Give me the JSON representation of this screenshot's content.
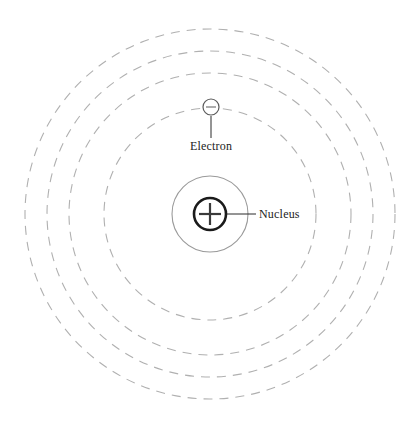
{
  "diagram": {
    "background_color": "#ffffff",
    "width": 419,
    "height": 426,
    "center": {
      "x": 210,
      "y": 214
    }
  },
  "nucleus": {
    "label": "Nucleus",
    "charge_symbol": "+",
    "radius": 16,
    "stroke_color": "#1a1a1a",
    "sign_color": "#3a3a3a",
    "label_x": 259,
    "label_y": 218,
    "leader": {
      "x1": 227,
      "y1": 214,
      "x2": 256,
      "y2": 214
    }
  },
  "electron": {
    "label": "Electron",
    "charge_symbol": "−",
    "radius": 8,
    "cx": 211,
    "cy": 107,
    "stroke_color": "#5a5a5a",
    "sign_color": "#6a6a6a",
    "label_x": 211,
    "label_y": 150,
    "leader": {
      "x1": 211,
      "y1": 116,
      "x2": 211,
      "y2": 138
    }
  },
  "orbits": [
    {
      "name": "orbit-inner-solid",
      "radius": 38,
      "style": "solid",
      "color": "#9a9a9a"
    },
    {
      "name": "orbit-shell-1",
      "radius": 106,
      "style": "dashed",
      "color": "#b0b0b0"
    },
    {
      "name": "orbit-shell-2",
      "radius": 141,
      "style": "dashed",
      "color": "#b0b0b0"
    },
    {
      "name": "orbit-shell-3",
      "radius": 163,
      "style": "dashed",
      "color": "#b0b0b0"
    },
    {
      "name": "orbit-shell-4",
      "radius": 185,
      "style": "dashed",
      "color": "#b0b0b0"
    }
  ]
}
